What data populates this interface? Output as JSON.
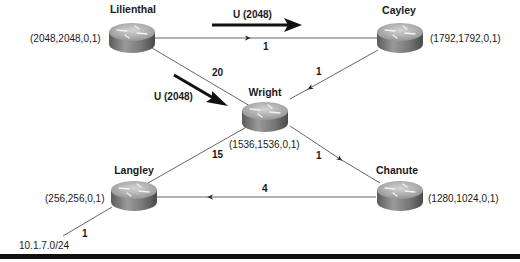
{
  "routers": [
    {
      "id": "lilienthal",
      "name": "Lilienthal",
      "metric": "(2048,2048,0,1)"
    },
    {
      "id": "cayley",
      "name": "Cayley",
      "metric": "(1792,1792,0,1)"
    },
    {
      "id": "wright",
      "name": "Wright",
      "metric": "(1536,1536,0,1)"
    },
    {
      "id": "langley",
      "name": "Langley",
      "metric": "(256,256,0,1)"
    },
    {
      "id": "chanute",
      "name": "Chanute",
      "metric": "(1280,1024,0,1)"
    }
  ],
  "links": [
    {
      "from": "lilienthal",
      "to": "cayley",
      "cost": "1",
      "direction": "toward-cayley"
    },
    {
      "from": "lilienthal",
      "to": "wright",
      "cost": "20",
      "direction": "none"
    },
    {
      "from": "cayley",
      "to": "wright",
      "cost": "1",
      "direction": "toward-wright"
    },
    {
      "from": "wright",
      "to": "chanute",
      "cost": "1",
      "direction": "toward-chanute"
    },
    {
      "from": "chanute",
      "to": "langley",
      "cost": "4",
      "direction": "toward-langley"
    },
    {
      "from": "wright",
      "to": "langley",
      "cost": "15",
      "direction": "none"
    },
    {
      "from": "langley",
      "to": "10.1.7.0/24",
      "cost": "1",
      "direction": "none"
    }
  ],
  "updates": [
    {
      "label": "U (2048)",
      "position": "top",
      "icon": "bold-arrow-right"
    },
    {
      "label": "U (2048)",
      "position": "left",
      "icon": "bold-arrow-down-right"
    }
  ],
  "subnet": {
    "label": "10.1.7.0/24"
  },
  "colors": {
    "line": "#555555",
    "arrow": "#111111",
    "router_top": "#b8b8b8",
    "router_side": "#6a6a6a"
  }
}
